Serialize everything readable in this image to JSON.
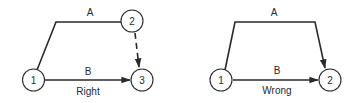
{
  "diagrams": [
    {
      "caption": "Right",
      "nodes": [
        {
          "id": "1",
          "label": "1"
        },
        {
          "id": "2",
          "label": "2"
        },
        {
          "id": "3",
          "label": "3"
        }
      ],
      "edges": [
        {
          "label": "A",
          "from": "1",
          "to": "2",
          "style": "solid"
        },
        {
          "label": "B",
          "from": "1",
          "to": "3",
          "style": "solid-arrow"
        },
        {
          "label": "",
          "from": "2",
          "to": "3",
          "style": "dashed-arrow"
        }
      ]
    },
    {
      "caption": "Wrong",
      "nodes": [
        {
          "id": "1",
          "label": "1"
        },
        {
          "id": "2",
          "label": "2"
        }
      ],
      "edges": [
        {
          "label": "A",
          "from": "1",
          "to": "2",
          "style": "solid-arrow"
        },
        {
          "label": "B",
          "from": "1",
          "to": "2",
          "style": "solid-arrow"
        }
      ]
    }
  ],
  "colors": {
    "stroke": "#2a2a2a",
    "background": "#ffffff"
  }
}
